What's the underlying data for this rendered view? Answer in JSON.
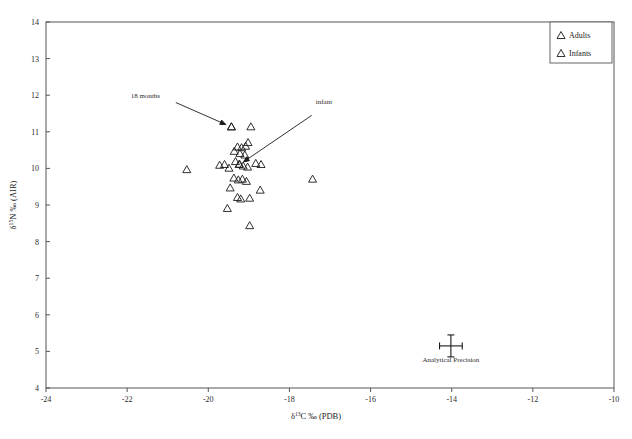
{
  "figure": {
    "background": "#ffffff",
    "frame_color": "#555555",
    "marker_color": "#1a1a1a"
  },
  "chart_data": {
    "type": "scatter",
    "title": "",
    "xlabel": "δ¹³C ‰ (PDB)",
    "ylabel": "δ¹⁵N ‰ (AIR)",
    "xlim": [
      -24,
      -10
    ],
    "ylim": [
      4,
      14
    ],
    "xticks": [
      -24,
      -22,
      -20,
      -18,
      -16,
      -14,
      -12,
      -10
    ],
    "xticklabels": [
      "-24",
      "-22",
      "-20",
      "-18",
      "-16",
      "-14",
      "-12",
      "-10"
    ],
    "yticks": [
      4,
      5,
      6,
      7,
      8,
      9,
      10,
      11,
      12,
      13,
      14
    ],
    "yticklabels": [
      "4",
      "5",
      "6",
      "7",
      "8",
      "9",
      "10",
      "11",
      "12",
      "13",
      "14"
    ],
    "grid": false,
    "legend_position": "top-right",
    "series": [
      {
        "name": "Adults",
        "marker": "triangle-up",
        "points": [
          [
            -19.43,
            11.15
          ],
          [
            -18.95,
            11.15
          ],
          [
            -19.02,
            10.72
          ],
          [
            -19.28,
            10.6
          ],
          [
            -19.18,
            10.58
          ],
          [
            -19.08,
            10.62
          ],
          [
            -19.36,
            10.48
          ],
          [
            -19.22,
            10.42
          ],
          [
            -19.1,
            10.38
          ],
          [
            -20.53,
            9.98
          ],
          [
            -19.72,
            10.1
          ],
          [
            -19.6,
            10.12
          ],
          [
            -19.49,
            10.02
          ],
          [
            -19.33,
            10.2
          ],
          [
            -19.24,
            10.12
          ],
          [
            -19.14,
            10.08
          ],
          [
            -19.03,
            10.05
          ],
          [
            -18.83,
            10.15
          ],
          [
            -18.7,
            10.12
          ],
          [
            -17.43,
            9.72
          ],
          [
            -19.37,
            9.75
          ],
          [
            -19.26,
            9.7
          ],
          [
            -19.16,
            9.72
          ],
          [
            -19.06,
            9.66
          ],
          [
            -19.46,
            9.48
          ],
          [
            -18.72,
            9.42
          ],
          [
            -19.28,
            9.22
          ],
          [
            -19.2,
            9.18
          ],
          [
            -18.98,
            9.2
          ],
          [
            -19.53,
            8.92
          ],
          [
            -18.98,
            8.45
          ]
        ]
      },
      {
        "name": "Infants",
        "marker": "triangle-up",
        "points": [
          [
            -19.43,
            11.15
          ],
          [
            -19.23,
            10.13
          ]
        ]
      }
    ],
    "annotations": [
      {
        "text": "18 months",
        "label_x": -21.55,
        "label_y": 11.93,
        "arrow_from_x": -20.8,
        "arrow_from_y": 11.8,
        "arrow_to_x": -19.57,
        "arrow_to_y": 11.2
      },
      {
        "text": "infant",
        "label_x": -17.35,
        "label_y": 11.75,
        "arrow_from_x": -17.45,
        "arrow_from_y": 11.45,
        "arrow_to_x": -19.13,
        "arrow_to_y": 10.18
      },
      {
        "text": "Analytical Precision",
        "label_x": -14.02,
        "label_y": 4.72,
        "error_bar_x": -14.02,
        "error_bar_y": 5.15,
        "error_bar_half_width": 0.28,
        "error_bar_half_height": 0.3
      }
    ]
  },
  "legend": {
    "entries": [
      {
        "label": "Adults",
        "marker": "triangle-up"
      },
      {
        "label": "Infants",
        "marker": "triangle-up"
      }
    ]
  },
  "axis_labels": {
    "x_delta": "δ",
    "x_superscript": "13",
    "x_rest": "C ‰ (PDB)",
    "y_delta": "δ",
    "y_superscript": "15",
    "y_rest": "N ‰ (AIR)"
  }
}
